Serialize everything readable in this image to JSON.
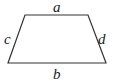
{
  "diagram": {
    "shape": "trapezoid",
    "stroke_color": "#333333",
    "vertices": {
      "top_left": [
        25,
        15
      ],
      "top_right": [
        88,
        15
      ],
      "bottom_right": [
        106,
        63
      ],
      "bottom_left": [
        8,
        63
      ]
    },
    "labels": {
      "top": "a",
      "bottom": "b",
      "left": "c",
      "right": "d"
    }
  }
}
